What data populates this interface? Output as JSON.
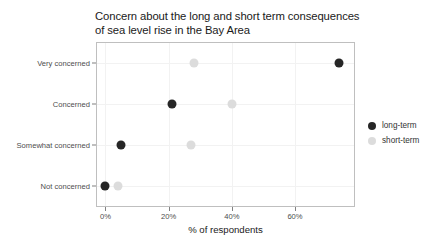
{
  "chart_data": {
    "type": "scatter",
    "title": "Concern about the long and short term consequences\nof sea level rise in the Bay Area",
    "xlabel": "% of respondents",
    "ylabel": "",
    "xlim": [
      -3,
      79
    ],
    "xticks": [
      0,
      20,
      40,
      60
    ],
    "xticklabels": [
      "0%",
      "20%",
      "40%",
      "60%"
    ],
    "categories": [
      "Very concerned",
      "Concerned",
      "Somewhat concerned",
      "Not concerned"
    ],
    "grid": true,
    "legend_position": "right",
    "series": [
      {
        "name": "long-term",
        "color": "#262626",
        "values": [
          74,
          21,
          5,
          0
        ]
      },
      {
        "name": "short-term",
        "color": "#dcdcdc",
        "values": [
          28,
          40,
          27,
          4
        ]
      }
    ]
  },
  "legend": {
    "items": [
      {
        "label": "long-term",
        "color": "#262626"
      },
      {
        "label": "short-term",
        "color": "#dcdcdc"
      }
    ]
  },
  "colors": {
    "panel_border": "#bfbfbf",
    "grid": "#f2f2f2",
    "axis_text": "#4d4d4d",
    "title_text": "#1a1a1a",
    "background": "#ffffff"
  }
}
